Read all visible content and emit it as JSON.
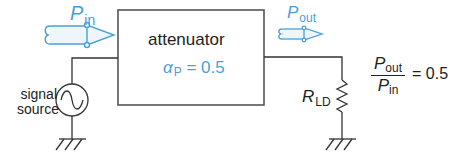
{
  "diagram": {
    "type": "circuit-diagram",
    "block": {
      "label": "attenuator",
      "parameter_symbol": "α",
      "parameter_subscript": "P",
      "parameter_eq": " = 0.5"
    },
    "input_arrow": {
      "symbol": "P",
      "subscript": "in"
    },
    "output_arrow": {
      "symbol": "P",
      "subscript": "out"
    },
    "source": {
      "label_line1": "signal",
      "label_line2": "source"
    },
    "load": {
      "symbol": "R",
      "subscript": "LD"
    },
    "ratio": {
      "numerator_symbol": "P",
      "numerator_subscript": "out",
      "denominator_symbol": "P",
      "denominator_subscript": "in",
      "equals": "= 0.5"
    },
    "colors": {
      "accent": "#4a9fd8",
      "line": "#333333",
      "text": "#222222"
    }
  }
}
